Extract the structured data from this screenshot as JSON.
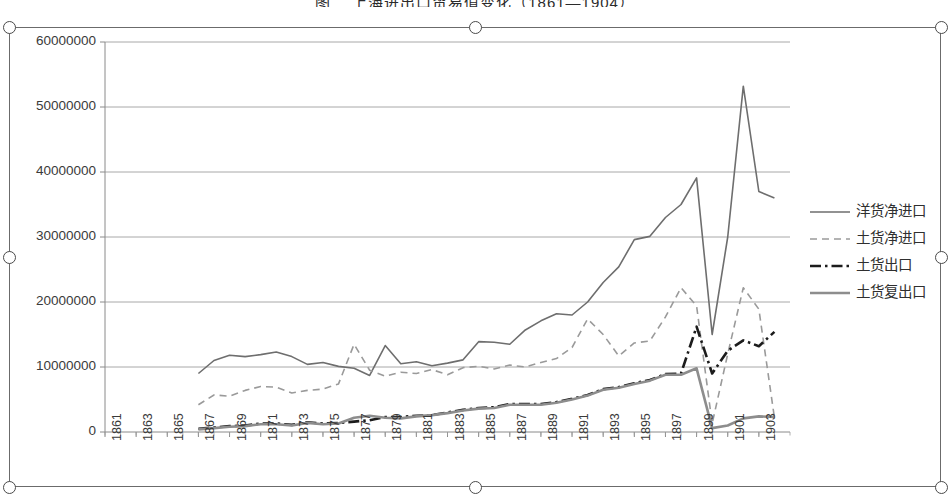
{
  "top_caption": "图二 上海进出口贸易值变化（1861—1904）",
  "chart_object": {
    "selected": true,
    "handle_name": "resize-handle"
  },
  "chart_data": {
    "type": "line",
    "title": "",
    "xlabel": "",
    "ylabel": "",
    "grid": true,
    "legend_position": "right",
    "xlim": [
      1861,
      1905
    ],
    "ylim": [
      0,
      60000000
    ],
    "ytick_step": 10000000,
    "yticks": [
      0,
      10000000,
      20000000,
      30000000,
      40000000,
      50000000,
      60000000
    ],
    "ytick_labels": [
      "0",
      "10000000",
      "20000000",
      "30000000",
      "40000000",
      "50000000",
      "60000000"
    ],
    "xticks": [
      1861,
      1863,
      1865,
      1867,
      1869,
      1871,
      1873,
      1875,
      1877,
      1879,
      1881,
      1883,
      1885,
      1887,
      1889,
      1891,
      1893,
      1895,
      1897,
      1899,
      1901,
      1903
    ],
    "xtick_labels": [
      "1861",
      "1863",
      "1865",
      "1867",
      "1869",
      "1871",
      "1873",
      "1875",
      "1877",
      "1879",
      "1881",
      "1883",
      "1885",
      "1887",
      "1889",
      "1891",
      "1893",
      "1895",
      "1897",
      "1899",
      "1901",
      "1903"
    ],
    "x": [
      1867,
      1868,
      1869,
      1870,
      1871,
      1872,
      1873,
      1874,
      1875,
      1876,
      1877,
      1878,
      1879,
      1880,
      1881,
      1882,
      1883,
      1884,
      1885,
      1886,
      1887,
      1888,
      1889,
      1890,
      1891,
      1892,
      1893,
      1894,
      1895,
      1896,
      1897,
      1898,
      1899,
      1900,
      1901,
      1902,
      1903,
      1904
    ],
    "series": [
      {
        "name": "洋货净进口",
        "style": "solid",
        "color": "#6e6e6e",
        "width": 1.6,
        "values": [
          9000000,
          11000000,
          11800000,
          11600000,
          11900000,
          12300000,
          11600000,
          10400000,
          10700000,
          10100000,
          9800000,
          8700000,
          13300000,
          10500000,
          10800000,
          10200000,
          10600000,
          11100000,
          13900000,
          13800000,
          13500000,
          15700000,
          17100000,
          18200000,
          18000000,
          20000000,
          23000000,
          25400000,
          29600000,
          30100000,
          33000000,
          35000000,
          39100000,
          15000000,
          30000000,
          53200000,
          37000000,
          36000000
        ]
      },
      {
        "name": "土货净进口",
        "style": "dashed",
        "color": "#9a9a9a",
        "width": 1.6,
        "values": [
          4200000,
          5700000,
          5500000,
          6400000,
          7000000,
          6900000,
          6000000,
          6400000,
          6600000,
          7400000,
          13500000,
          9500000,
          8600000,
          9200000,
          9000000,
          9600000,
          8800000,
          9900000,
          10100000,
          9700000,
          10300000,
          10000000,
          10700000,
          11300000,
          13000000,
          17400000,
          15000000,
          11700000,
          13700000,
          14000000,
          17700000,
          22200000,
          19400000,
          1300000,
          12000000,
          22200000,
          18900000,
          2200000
        ]
      },
      {
        "name": "土货出口",
        "style": "dashdot",
        "color": "#1c1c1c",
        "width": 2.6,
        "values": [
          500000,
          700000,
          900000,
          1000000,
          1300000,
          1300000,
          1100000,
          1500000,
          1300000,
          1400000,
          1600000,
          1800000,
          2300000,
          2300000,
          2500000,
          2600000,
          3000000,
          3400000,
          3700000,
          3800000,
          4300000,
          4300000,
          4300000,
          4600000,
          5100000,
          5700000,
          6600000,
          6900000,
          7500000,
          8000000,
          8900000,
          9000000,
          16200000,
          9000000,
          12500000,
          14100000,
          13200000,
          15400000
        ]
      },
      {
        "name": "土货复出口",
        "style": "solid-thick",
        "color": "#8d8d8d",
        "width": 2.6,
        "values": [
          400000,
          600000,
          800000,
          900000,
          1200000,
          1200000,
          1000000,
          1400000,
          1200000,
          1300000,
          2200000,
          2500000,
          2200000,
          2100000,
          2400000,
          2600000,
          2900000,
          3300000,
          3600000,
          3700000,
          4200000,
          4200000,
          4200000,
          4500000,
          5000000,
          5600000,
          6500000,
          6800000,
          7400000,
          7900000,
          8800000,
          8800000,
          9800000,
          600000,
          1000000,
          2100000,
          2400000,
          2300000
        ]
      }
    ]
  }
}
